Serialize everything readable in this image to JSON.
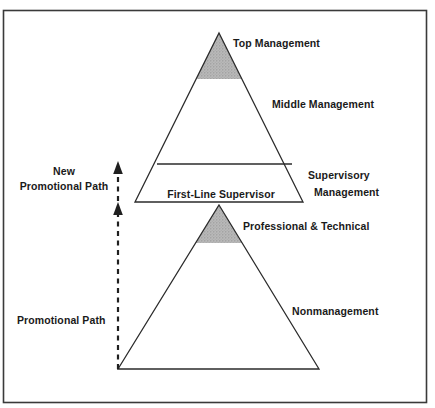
{
  "diagram": {
    "frame": {
      "color": "#3a3a3a"
    },
    "colors": {
      "line": "#2b2b2b",
      "shade_fill": "#b3b3b3",
      "text": "#1a1a1a",
      "background": "#ffffff"
    },
    "labels": {
      "top_management": "Top Management",
      "middle_management": "Middle Management",
      "supervisory_line1": "Supervisory",
      "supervisory_line2": "Management",
      "first_line_supervisor": "First-Line Supervisor",
      "professional_technical": "Professional & Technical",
      "nonmanagement": "Nonmanagement",
      "new_promotional_path_line1": "New",
      "new_promotional_path_line2": "Promotional Path",
      "promotional_path": "Promotional Path"
    },
    "structure": {
      "upper_pyramid": {
        "name": "management-pyramid",
        "apex": {
          "x": 219,
          "y": 33
        },
        "base_left": {
          "x": 135,
          "y": 202
        },
        "base_right": {
          "x": 303,
          "y": 202
        },
        "shaded_band": {
          "label": "Top Management",
          "bottom_y": 79
        },
        "divider_y": 164,
        "bands": [
          "Top Management",
          "Middle Management",
          "Supervisory Management"
        ]
      },
      "lower_pyramid": {
        "name": "nonmanagement-pyramid",
        "apex": {
          "x": 219,
          "y": 205
        },
        "base_left": {
          "x": 118,
          "y": 369
        },
        "base_right": {
          "x": 319,
          "y": 369
        },
        "shaded_band": {
          "label": "Professional & Technical",
          "bottom_y": 243
        },
        "bands": [
          "Professional & Technical",
          "Nonmanagement"
        ]
      },
      "paths": [
        {
          "name": "new-promotional-path",
          "label": "New Promotional Path",
          "from_y": 202,
          "to_y": 163,
          "x": 118,
          "style": "dashed-with-arrow"
        },
        {
          "name": "promotional-path",
          "label": "Promotional Path",
          "from_y": 369,
          "to_y": 204,
          "x": 118,
          "style": "dashed-with-arrow"
        }
      ]
    }
  }
}
